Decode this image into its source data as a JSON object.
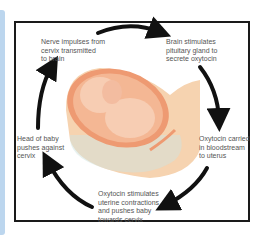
{
  "diagram": {
    "steps": [
      {
        "id": "nerve",
        "text": "Nerve impulses from\ncervix transmitted\nto brain"
      },
      {
        "id": "brain",
        "text": "Brain stimulates\npituitary gland to\nsecrete oxytocin"
      },
      {
        "id": "blood",
        "text": "Oxytocin carried\nin bloodstream\nto uterus"
      },
      {
        "id": "uterus",
        "text": "Oxytocin stimulates\nuterine contractions\nand pushes baby\ntowards cervix"
      },
      {
        "id": "head",
        "text": "Head of baby\npushes against\ncervix"
      }
    ],
    "colors": {
      "frame": "#1a1a1a",
      "arrow": "#111111",
      "skin": "#f6d3b0",
      "uterus": "#ee9a72",
      "fetus": "#f7c9ae",
      "side_strip": "#bcd6ee"
    }
  }
}
